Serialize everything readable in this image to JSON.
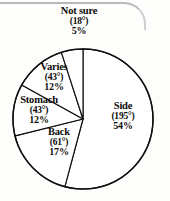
{
  "chart_data": {
    "type": "pie",
    "title": "",
    "subtitle": "",
    "xlabel": "",
    "ylabel": "",
    "legend_position": "none",
    "grid": false,
    "labels_inside": true,
    "total_degrees": 360,
    "total_percent": 100,
    "categories": [
      "Side",
      "Back",
      "Stomach",
      "Varies",
      "Not sure"
    ],
    "values": [
      54,
      17,
      12,
      12,
      5
    ],
    "degrees": [
      195,
      61,
      43,
      43,
      18
    ],
    "slices": [
      {
        "name": "Side",
        "degrees": 195,
        "degrees_text": "(195°)",
        "percent": 54,
        "percent_text": "54%",
        "color": "#ffffff",
        "start_angle_deg": 0,
        "sweep_deg": 195,
        "direction": "clockwise"
      },
      {
        "name": "Back",
        "degrees": 61,
        "degrees_text": "(61°)",
        "percent": 17,
        "percent_text": "17%",
        "color": "#ffffff",
        "start_angle_deg": 195,
        "sweep_deg": 61,
        "direction": "clockwise"
      },
      {
        "name": "Stomach",
        "degrees": 43,
        "degrees_text": "(43°)",
        "percent": 12,
        "percent_text": "12%",
        "color": "#ffffff",
        "start_angle_deg": 256,
        "sweep_deg": 43,
        "direction": "clockwise"
      },
      {
        "name": "Varies",
        "degrees": 43,
        "degrees_text": "(43°)",
        "percent": 12,
        "percent_text": "12%",
        "color": "#ffffff",
        "start_angle_deg": 299,
        "sweep_deg": 43,
        "direction": "clockwise"
      },
      {
        "name": "Not sure",
        "degrees": 18,
        "degrees_text": "(18°)",
        "percent": 5,
        "percent_text": "5%",
        "color": "#ffffff",
        "start_angle_deg": 342,
        "sweep_deg": 18,
        "direction": "clockwise"
      }
    ]
  },
  "labels": {
    "not_sure": {
      "name": "Not sure",
      "degrees": "(18°)",
      "percent": "5%"
    },
    "varies": {
      "name": "Varies",
      "degrees": "(43°)",
      "percent": "12%"
    },
    "stomach": {
      "name": "Stomach",
      "degrees": "(43°)",
      "percent": "12%"
    },
    "back": {
      "name": "Back",
      "degrees": "(61°)",
      "percent": "17%"
    },
    "side": {
      "name": "Side",
      "degrees": "(195°)",
      "percent": "54%"
    }
  },
  "style": {
    "stroke_color": "#100f0d",
    "fill_color": "#ffffff",
    "background_color": "#fdfdfb",
    "border_artifact_color": "#b9b9bb"
  },
  "geometry": {
    "center_x": 83,
    "center_y": 119,
    "radius": 70
  }
}
